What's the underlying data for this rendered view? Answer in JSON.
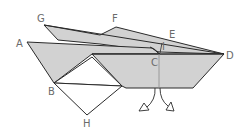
{
  "diagram": {
    "colors": {
      "fill": "#d2d2d2",
      "stroke": "#2a2a2a",
      "label": "#6b6b6b",
      "background": "#ffffff"
    },
    "labels": {
      "G": "G",
      "F": "F",
      "E": "E",
      "A": "A",
      "I": "I",
      "D": "D",
      "C": "C",
      "B": "B",
      "H": "H"
    },
    "icons": {
      "fold_arrows": "curved-arrows-down"
    }
  }
}
